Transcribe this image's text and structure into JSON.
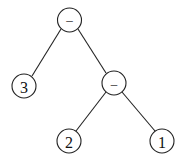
{
  "diagram": {
    "type": "expression-tree",
    "nodes": [
      {
        "id": "root",
        "label": "–",
        "x": 69.5,
        "y": 20,
        "r": 12,
        "kind": "operator"
      },
      {
        "id": "n3",
        "label": "3",
        "x": 24,
        "y": 86,
        "r": 12,
        "kind": "operand"
      },
      {
        "id": "sub",
        "label": "–",
        "x": 114,
        "y": 83,
        "r": 12,
        "kind": "operator"
      },
      {
        "id": "n2",
        "label": "2",
        "x": 69,
        "y": 141,
        "r": 12,
        "kind": "operand"
      },
      {
        "id": "n1",
        "label": "1",
        "x": 162,
        "y": 141,
        "r": 12,
        "kind": "operand"
      }
    ],
    "edges": [
      {
        "from": "root",
        "to": "n3"
      },
      {
        "from": "root",
        "to": "sub"
      },
      {
        "from": "sub",
        "to": "n2"
      },
      {
        "from": "sub",
        "to": "n1"
      }
    ]
  }
}
